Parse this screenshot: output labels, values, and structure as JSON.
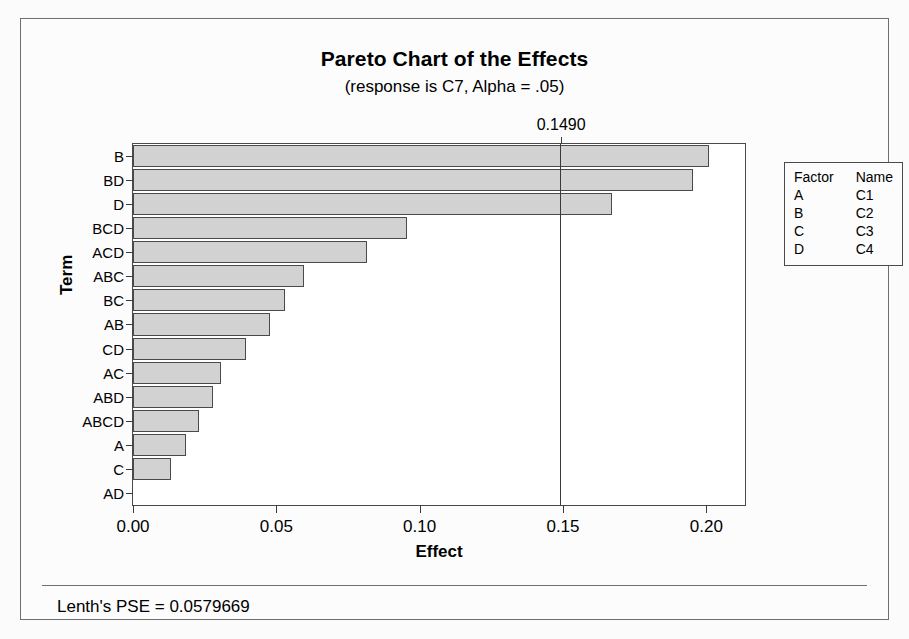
{
  "chart_data": {
    "type": "bar",
    "orientation": "horizontal",
    "title": "Pareto Chart of the Effects",
    "subtitle": "(response is C7, Alpha = .05)",
    "xlabel": "Effect",
    "ylabel": "Term",
    "xlim": [
      0.0,
      0.2135
    ],
    "xticks": [
      0.0,
      0.05,
      0.1,
      0.15,
      0.2
    ],
    "xtick_labels": [
      "0.00",
      "0.05",
      "0.10",
      "0.15",
      "0.20"
    ],
    "grid": false,
    "categories": [
      "B",
      "BD",
      "D",
      "BCD",
      "ACD",
      "ABC",
      "BC",
      "AB",
      "CD",
      "AC",
      "ABD",
      "ABCD",
      "A",
      "C",
      "AD"
    ],
    "values": [
      0.201,
      0.1952,
      0.167,
      0.0955,
      0.0816,
      0.0597,
      0.053,
      0.0478,
      0.0394,
      0.0306,
      0.0279,
      0.023,
      0.0184,
      0.0132,
      0.0
    ],
    "reference_line": {
      "value": 0.149,
      "label": "0.1490"
    },
    "legend": {
      "position": "right",
      "headers": [
        "Factor",
        "Name"
      ],
      "rows": [
        {
          "factor": "A",
          "name": "C1"
        },
        {
          "factor": "B",
          "name": "C2"
        },
        {
          "factor": "C",
          "name": "C3"
        },
        {
          "factor": "D",
          "name": "C4"
        }
      ]
    },
    "footnote": "Lenth's PSE = 0.0579669",
    "colors": {
      "bar_fill": "#d2d2d2",
      "bar_border": "#4a4a4a",
      "reference_line": "#3a3a3a",
      "background": "#fbfbfb",
      "plot_background": "#ffffff"
    }
  },
  "footer": {
    "text": "Lenth's PSE = 0.0579669"
  }
}
